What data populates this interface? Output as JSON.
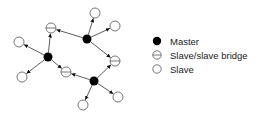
{
  "legend": {
    "items": [
      {
        "type": "master",
        "label": "Master"
      },
      {
        "type": "bridge",
        "label": "Slave/slave bridge"
      },
      {
        "type": "slave",
        "label": "Slave"
      }
    ]
  },
  "colors": {
    "line": "#333333",
    "master_fill": "#000000",
    "node_stroke": "#555555",
    "node_fill": "#ffffff"
  },
  "nodes": [
    {
      "id": "m1",
      "type": "master",
      "x": 48,
      "y": 57
    },
    {
      "id": "m2",
      "type": "master",
      "x": 87,
      "y": 39
    },
    {
      "id": "m3",
      "type": "master",
      "x": 94,
      "y": 81
    },
    {
      "id": "b1",
      "type": "bridge",
      "x": 51,
      "y": 28
    },
    {
      "id": "b2",
      "type": "bridge",
      "x": 115,
      "y": 61
    },
    {
      "id": "b3",
      "type": "bridge",
      "x": 66,
      "y": 72
    },
    {
      "id": "s1",
      "type": "slave",
      "x": 19,
      "y": 42
    },
    {
      "id": "s2",
      "type": "slave",
      "x": 22,
      "y": 77
    },
    {
      "id": "s3",
      "type": "slave",
      "x": 95,
      "y": 13
    },
    {
      "id": "s4",
      "type": "slave",
      "x": 115,
      "y": 26
    },
    {
      "id": "s5",
      "type": "slave",
      "x": 83,
      "y": 105
    },
    {
      "id": "s6",
      "type": "slave",
      "x": 118,
      "y": 97
    }
  ],
  "edges": [
    {
      "from": "m1",
      "to": "s1"
    },
    {
      "from": "m1",
      "to": "s2"
    },
    {
      "from": "m1",
      "to": "b1"
    },
    {
      "from": "m1",
      "to": "b3"
    },
    {
      "from": "m2",
      "to": "b1"
    },
    {
      "from": "m2",
      "to": "s3"
    },
    {
      "from": "m2",
      "to": "s4"
    },
    {
      "from": "m2",
      "to": "b2"
    },
    {
      "from": "m3",
      "to": "b2"
    },
    {
      "from": "m3",
      "to": "b3"
    },
    {
      "from": "m3",
      "to": "s5"
    },
    {
      "from": "m3",
      "to": "s6"
    }
  ]
}
